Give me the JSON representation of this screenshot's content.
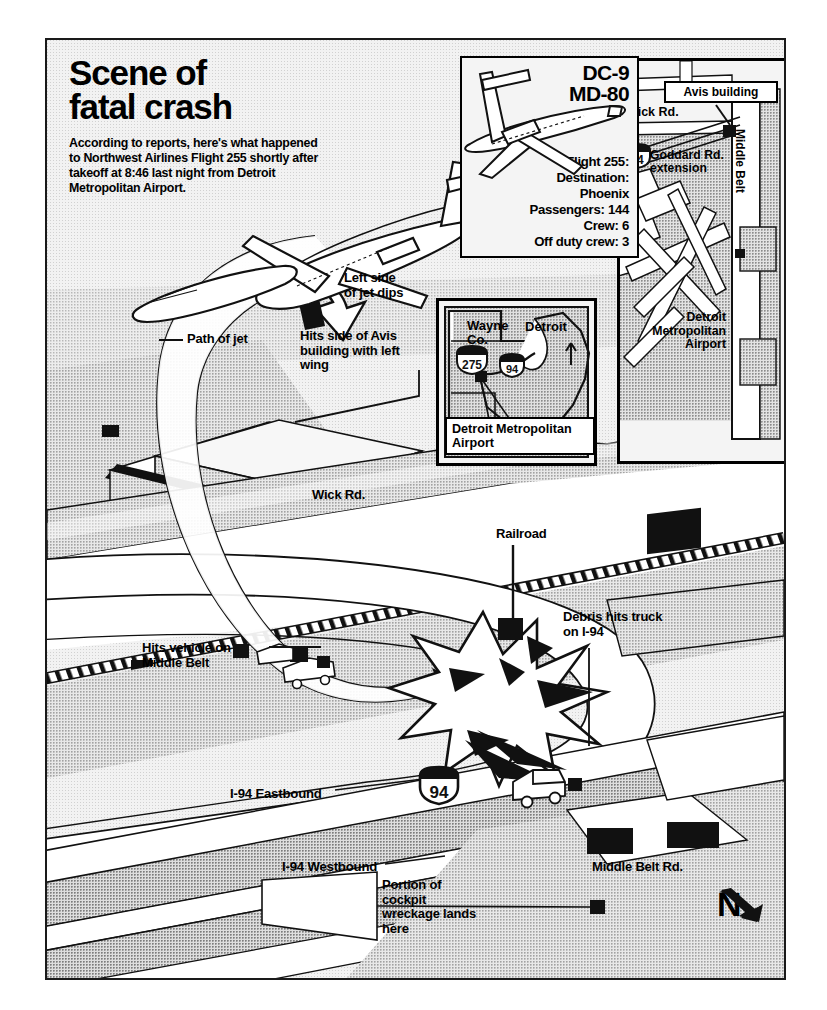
{
  "headline": {
    "line1": "Scene of",
    "line2": "fatal crash",
    "body": "According to reports, here's what happened to Northwest Airlines Flight 255 shortly after takeoff at 8:46 last night from Detroit Metropolitan Airport."
  },
  "aircraft_panel": {
    "model_line1": "DC-9",
    "model_line2": "MD-80",
    "specs": [
      "Flight 255:",
      "Destination:",
      "Phoenix",
      "Passengers:  144",
      "Crew: 6",
      "Off duty crew: 3"
    ]
  },
  "airport_panel": {
    "avis_callout": "Avis building",
    "wick_road": "Wick Rd.",
    "goddard": "Goddard Rd.\nextension",
    "middle_belt": "Middle Belt",
    "airport_name": "Detroit\nMetropolitan\nAirport",
    "shield_94": "94"
  },
  "inset_panel": {
    "wayne_county": "Wayne\nCo.",
    "detroit": "Detroit",
    "shield_275": "275",
    "shield_94": "94",
    "callout": "Detroit Metropolitan\nAirport"
  },
  "map_labels": {
    "left_side_dips": "Left side\nof jet dips",
    "path_of_jet": "Path of jet",
    "hits_avis": "Hits side of Avis\nbuilding with left\nwing",
    "wick_road": "Wick Rd.",
    "railroad": "Railroad",
    "hits_vehicle": "Hits vehicle on\nMiddle Belt",
    "debris_truck": "Debris hits truck\non I-94",
    "i94_east": "I-94 Eastbound",
    "i94_west": "I-94 Westbound",
    "cockpit_wreckage": "Portion of\ncockpit\nwreckage lands\nhere",
    "middle_belt_road": "Middle Belt Rd.",
    "shield_94": "94",
    "compass": "N"
  },
  "colors": {
    "ink": "#000000",
    "paper": "#f2f2f2",
    "ground_tint": "#cfcfcf",
    "road_fill": "#ffffff",
    "dark_fill": "#111111"
  }
}
